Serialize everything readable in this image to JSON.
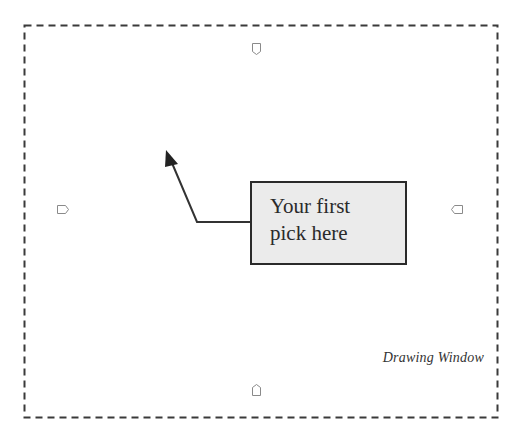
{
  "diagram": {
    "frame": {
      "style": "dashed",
      "color": "#3a3a3a"
    },
    "callout": {
      "line1": "Your first",
      "line2": "pick here",
      "fill": "#ebebeb"
    },
    "caption": "Drawing Window",
    "markers": [
      {
        "name": "top-marker",
        "direction": "down"
      },
      {
        "name": "left-marker",
        "direction": "right"
      },
      {
        "name": "right-marker",
        "direction": "left"
      },
      {
        "name": "bottom-marker",
        "direction": "up"
      }
    ]
  }
}
